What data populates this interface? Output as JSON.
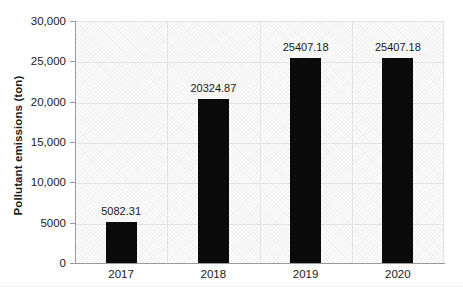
{
  "chart_data": {
    "type": "bar",
    "title": "",
    "xlabel": "",
    "ylabel": "Pollutant emissions (ton)",
    "categories": [
      "2017",
      "2018",
      "2019",
      "2020"
    ],
    "values": [
      5082.31,
      20324.87,
      25407.18,
      25407.18
    ],
    "value_labels": [
      "5082.31",
      "20324.87",
      "25407.18",
      "25407.18"
    ],
    "ylim": [
      0,
      30000
    ],
    "ytick_values": [
      30000,
      25000,
      20000,
      15000,
      10000,
      5000,
      0
    ],
    "ytick_labels": [
      "30,000",
      "25,000",
      "20,000",
      "15,000",
      "10,000",
      "5000",
      "0"
    ],
    "grid": "horizontal-and-vertical",
    "legend": "none",
    "series": [
      {
        "name": "Pollutant emissions",
        "values": [
          5082.31,
          20324.87,
          25407.18,
          25407.18
        ],
        "color": "#0a0a0a"
      }
    ],
    "colors": {
      "bar": "#0a0a0a",
      "grid": "#e4e4e4",
      "axis": "#9a9a9a",
      "plot_background": "#fbfbfb",
      "text": "#1a1a1a"
    }
  }
}
